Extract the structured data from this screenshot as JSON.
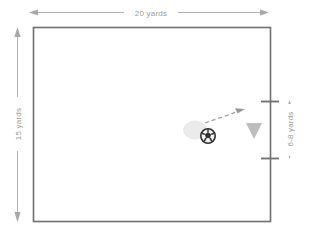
{
  "diagram": {
    "pitch": {
      "shape": "rectangle",
      "border_color": "#6f6f6f",
      "fill_color": "#ffffff",
      "x": 33,
      "y": 27,
      "width": 237,
      "height": 194
    },
    "dimensions": [
      {
        "name": "width-dimension",
        "label": "20 yards",
        "orientation": "horizontal",
        "value": 20,
        "unit": "yards",
        "color": "#a8a8a8",
        "x1": 30,
        "y1": 12,
        "x2": 268,
        "y2": 12
      },
      {
        "name": "height-dimension",
        "label": "15 yards",
        "orientation": "vertical",
        "value": 15,
        "unit": "yards",
        "color": "#a8a8a8",
        "x1": 17,
        "y1": 28,
        "x2": 17,
        "y2": 221
      },
      {
        "name": "goal-width-dimension",
        "label": "6-8 yards",
        "orientation": "vertical",
        "value": "6-8",
        "unit": "yards",
        "color": "#a8a8a8",
        "x1": 289,
        "y1": 101,
        "x2": 289,
        "y2": 158
      }
    ],
    "goal": {
      "name": "goal-marker",
      "side": "right",
      "tick_color": "#6f6f6f",
      "top_tick_y": 101,
      "bottom_tick_y": 158,
      "line_x": 270
    },
    "markers": [
      {
        "name": "player-marker",
        "type": "ellipse",
        "color": "#e6e6e6",
        "cx": 195,
        "cy": 130,
        "rx": 11,
        "ry": 8.5
      },
      {
        "name": "soccer-ball",
        "type": "ball",
        "color": "#3a3a3a",
        "cx": 208,
        "cy": 136,
        "r": 7
      },
      {
        "name": "cone-marker",
        "type": "triangle-down",
        "color": "#b8b8b8",
        "cx": 254,
        "cy": 131,
        "size": 15
      }
    ],
    "movement": [
      {
        "name": "pass-arrow",
        "style": "dashed",
        "color": "#9a9a9a",
        "x1": 206,
        "y1": 123,
        "x2": 244,
        "y2": 110
      }
    ]
  }
}
